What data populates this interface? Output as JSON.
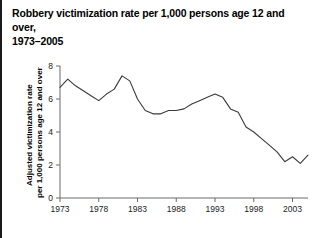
{
  "chart_data": {
    "type": "line",
    "title": "Robbery victimization rate per 1,000 persons age 12 and over, 1973–2005",
    "title_line1": "Robbery victimization rate per 1,000 persons age 12 and over,",
    "title_line2": "1973–2005",
    "xlabel": "",
    "ylabel": "Adjusted victimization rate per 1,000 persons age 12 and over",
    "ylabel_line1": "Adjusted victimization rate",
    "ylabel_line2": "per 1,000 persons age 12 and over",
    "xlim": [
      1973,
      2005
    ],
    "ylim": [
      0,
      8
    ],
    "grid": false,
    "legend": false,
    "line_color": "#3a3a3a",
    "axis_color": "#6b6b6b",
    "text_color": "#000000",
    "background": "#ffffff",
    "yticks": [
      0,
      2,
      4,
      6,
      8
    ],
    "ytick_labels": [
      "0",
      "2",
      "4",
      "6",
      "8"
    ],
    "xticks": [
      1973,
      1978,
      1983,
      1988,
      1993,
      1998,
      2003
    ],
    "xtick_labels": [
      "1973",
      "1978",
      "1983",
      "1988",
      "1993",
      "1998",
      "2003"
    ],
    "x": [
      1973,
      1974,
      1975,
      1976,
      1977,
      1978,
      1979,
      1980,
      1981,
      1982,
      1983,
      1984,
      1985,
      1986,
      1987,
      1988,
      1989,
      1990,
      1991,
      1992,
      1993,
      1994,
      1995,
      1996,
      1997,
      1998,
      1999,
      2000,
      2001,
      2002,
      2003,
      2004,
      2005
    ],
    "values": [
      6.7,
      7.2,
      6.8,
      6.5,
      6.2,
      5.9,
      6.3,
      6.6,
      7.4,
      7.1,
      6.0,
      5.3,
      5.1,
      5.1,
      5.3,
      5.3,
      5.4,
      5.7,
      5.9,
      6.1,
      6.3,
      6.1,
      5.4,
      5.2,
      4.3,
      4.0,
      3.6,
      3.2,
      2.8,
      2.2,
      2.5,
      2.1,
      2.6
    ]
  }
}
